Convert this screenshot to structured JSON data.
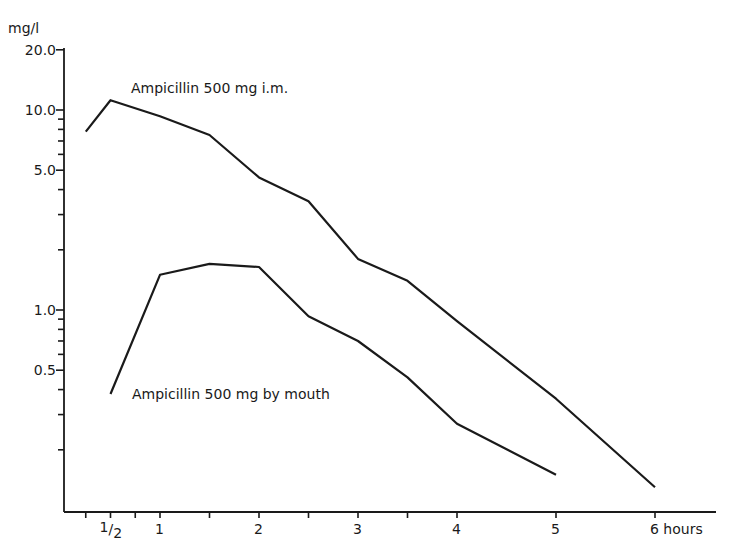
{
  "chart_data": {
    "type": "line",
    "title": "",
    "ylabel": "mg/l",
    "xlabel": "hours",
    "yscale": "log",
    "ylim": [
      0.1,
      20.0
    ],
    "xlim": [
      0,
      6.5
    ],
    "grid": false,
    "legend": "inline labels",
    "y_ticks": [
      {
        "value": 20.0,
        "label": "20.0"
      },
      {
        "value": 10.0,
        "label": "10.0"
      },
      {
        "value": 5.0,
        "label": "5.0"
      },
      {
        "value": 1.0,
        "label": "1.0"
      },
      {
        "value": 0.5,
        "label": "0.5"
      }
    ],
    "y_minor_ticks": [
      9,
      8,
      7,
      6,
      4,
      3,
      2,
      0.9,
      0.8,
      0.7,
      0.6,
      0.4,
      0.3,
      0.2
    ],
    "x_ticks": [
      {
        "value": 0.5,
        "label": "1/2"
      },
      {
        "value": 1,
        "label": "1"
      },
      {
        "value": 2,
        "label": "2"
      },
      {
        "value": 3,
        "label": "3"
      },
      {
        "value": 4,
        "label": "4"
      },
      {
        "value": 5,
        "label": "5"
      },
      {
        "value": 6,
        "label": "6 hours"
      }
    ],
    "x_minor_ticks": [
      0.25,
      0.75,
      1.5,
      2.5,
      3.5
    ],
    "series": [
      {
        "name": "Ampicillin 500 mg i.m.",
        "label": "Ampicillin 500 mg i.m.",
        "x": [
          0.25,
          0.5,
          1,
          1.5,
          2,
          2.5,
          3,
          3.5,
          4,
          5,
          6
        ],
        "values": [
          7.8,
          11.2,
          9.3,
          7.5,
          4.6,
          3.5,
          1.8,
          1.4,
          0.88,
          0.36,
          0.13
        ]
      },
      {
        "name": "Ampicillin 500 mg by mouth",
        "label": "Ampicillin 500 mg by mouth",
        "x": [
          0.5,
          1,
          1.5,
          2,
          2.5,
          3,
          3.5,
          4,
          5
        ],
        "values": [
          0.38,
          1.5,
          1.7,
          1.64,
          0.93,
          0.7,
          0.46,
          0.27,
          0.15
        ]
      }
    ]
  }
}
